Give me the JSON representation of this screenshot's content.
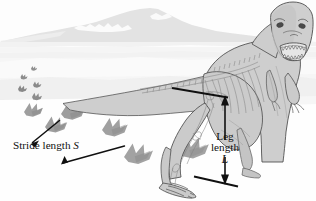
{
  "figure": {
    "width": 316,
    "height": 201,
    "background_color": "#ffffff"
  },
  "labels": {
    "stride": {
      "text": "Stride length",
      "symbol": "S",
      "full": "Stride length S"
    },
    "leg": {
      "line1": "Leg",
      "line2": "length",
      "symbol": "L",
      "full": "Leg length L"
    }
  },
  "annotations": [
    {
      "name": "stride-length-measure",
      "label": "Stride length S",
      "symbol": "S",
      "type": "double-arrow-split",
      "orientation": "diagonal",
      "measures": "distance between successive same-foot footprints"
    },
    {
      "name": "leg-length-measure",
      "label": "Leg length L",
      "symbol": "L",
      "type": "double-arrow",
      "orientation": "vertical",
      "measures": "hip height to ground"
    }
  ],
  "scene": {
    "subject": "tyrannosaur dinosaur",
    "footprint_count": 9,
    "footprint_toes": 3,
    "background_elements": [
      "mountain",
      "horizon",
      "ground"
    ]
  },
  "colors": {
    "body_fill": "#cfcfcf",
    "body_outline": "#4a4a4a",
    "skeleton_line": "#777777",
    "footprint_near": "#9b9b9b",
    "footprint_far": "#8a8a8a",
    "mountain": "#e4e4e4",
    "ground": "#efefef",
    "arrow": "#111111",
    "text": "#101010"
  }
}
